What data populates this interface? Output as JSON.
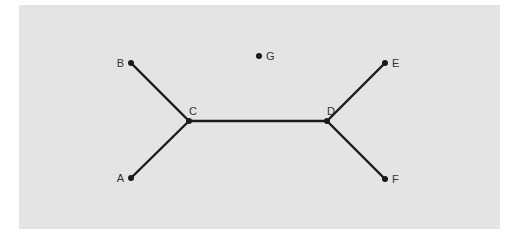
{
  "diagram": {
    "background": "#e4e4e4",
    "edge_color": "#1a1a1a",
    "node_color": "#1a1a1a",
    "nodes": [
      {
        "id": "A",
        "label": "A",
        "x": 131,
        "y": 178,
        "label_side": "left"
      },
      {
        "id": "B",
        "label": "B",
        "x": 131,
        "y": 63,
        "label_side": "left"
      },
      {
        "id": "C",
        "label": "C",
        "x": 189,
        "y": 121,
        "label_side": "top"
      },
      {
        "id": "D",
        "label": "D",
        "x": 327,
        "y": 121,
        "label_side": "top"
      },
      {
        "id": "E",
        "label": "E",
        "x": 385,
        "y": 63,
        "label_side": "right"
      },
      {
        "id": "F",
        "label": "F",
        "x": 385,
        "y": 179,
        "label_side": "right"
      },
      {
        "id": "G",
        "label": "G",
        "x": 259,
        "y": 56,
        "label_side": "right"
      }
    ],
    "edges": [
      {
        "from": "B",
        "to": "C"
      },
      {
        "from": "A",
        "to": "C"
      },
      {
        "from": "C",
        "to": "D"
      },
      {
        "from": "D",
        "to": "E"
      },
      {
        "from": "D",
        "to": "F"
      }
    ]
  }
}
